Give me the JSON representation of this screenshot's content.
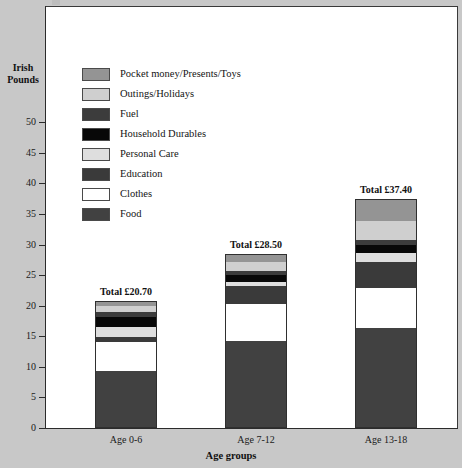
{
  "chart_data": {
    "type": "bar",
    "variant": "stacked",
    "title": "",
    "xlabel": "Age groups",
    "ylabel": "Irish Pounds",
    "categories": [
      "Age 0-6",
      "Age 7-12",
      "Age 13-18"
    ],
    "ylim": [
      0,
      52
    ],
    "yticks": [
      0,
      5,
      10,
      15,
      20,
      25,
      30,
      35,
      40,
      45,
      50
    ],
    "ytick_labels": [
      "0",
      "5",
      "10",
      "15",
      "20",
      "25",
      "30",
      "35",
      "40",
      "45",
      "50"
    ],
    "grid": false,
    "legend_position": "upper left inside",
    "series": [
      {
        "name": "Food",
        "color": "#414141",
        "values": [
          9.4,
          14.3,
          16.4
        ]
      },
      {
        "name": "Clothes",
        "color": "#ffffff",
        "values": [
          4.7,
          5.9,
          6.5
        ]
      },
      {
        "name": "Education",
        "color": "#3a3a3a",
        "values": [
          0.7,
          3.0,
          4.3
        ]
      },
      {
        "name": "Personal Care",
        "color": "#dedede",
        "values": [
          1.7,
          0.7,
          1.4
        ]
      },
      {
        "name": "Household Durables",
        "color": "#080808",
        "values": [
          1.6,
          1.1,
          1.3
        ]
      },
      {
        "name": "Fuel",
        "color": "#3c3c3c",
        "values": [
          0.9,
          0.7,
          0.9
        ]
      },
      {
        "name": "Outings/Holidays",
        "color": "#cfcfcf",
        "values": [
          0.9,
          1.5,
          3.1
        ]
      },
      {
        "name": "Pocket money/Presents/Toys",
        "color": "#949494",
        "values": [
          0.8,
          1.3,
          3.5
        ]
      }
    ],
    "bar_totals": [
      "Total £20.70",
      "Total £28.50",
      "Total £37.40"
    ],
    "totals_numeric": [
      20.7,
      28.5,
      37.4
    ]
  },
  "legend": {
    "items": [
      {
        "label": "Pocket money/Presents/Toys",
        "color": "#949494"
      },
      {
        "label": "Outings/Holidays",
        "color": "#cfcfcf"
      },
      {
        "label": "Fuel",
        "color": "#3c3c3c"
      },
      {
        "label": "Household Durables",
        "color": "#080808"
      },
      {
        "label": "Personal Care",
        "color": "#dedede"
      },
      {
        "label": "Education",
        "color": "#3a3a3a"
      },
      {
        "label": "Clothes",
        "color": "#ffffff"
      },
      {
        "label": "Food",
        "color": "#414141"
      }
    ]
  },
  "axes": {
    "y_title_line1": "Irish",
    "y_title_line2": "Pounds",
    "x_title": "Age groups"
  },
  "colors": {
    "page_background": "#c8c8c8",
    "panel_background": "#ffffff",
    "axis": "#2b2b2b",
    "text": "#1a1a1a"
  }
}
